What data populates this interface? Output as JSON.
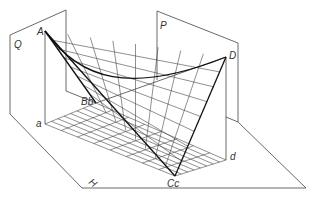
{
  "diagram": {
    "type": "hyperbolic-paraboloid-projection",
    "planes": {
      "Q": "Q",
      "P": "P",
      "H": "H"
    },
    "points": {
      "A": "A",
      "B": "B",
      "C": "C",
      "D": "D",
      "a": "a",
      "b": "b",
      "c": "c",
      "d": "d"
    },
    "combined_labels": {
      "Bb": "Bb",
      "Cc": "Cc"
    },
    "colors": {
      "line": "#444444",
      "edge": "#111111",
      "background": "#ffffff"
    },
    "grid_divisions": 8
  }
}
